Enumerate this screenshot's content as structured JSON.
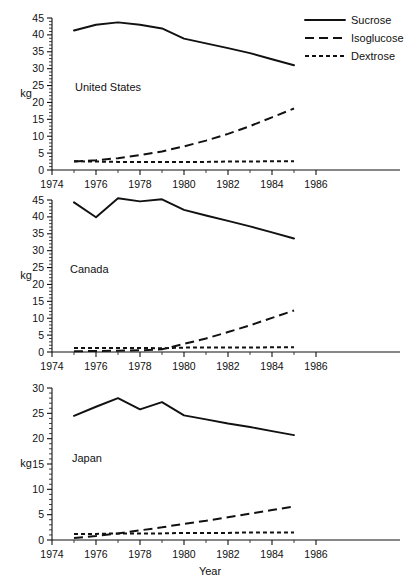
{
  "figure": {
    "xlabel": "Year",
    "ylabel": "kg",
    "legend": [
      {
        "name": "Sucrose",
        "style": "solid"
      },
      {
        "name": "Isoglucose",
        "style": "long-dash"
      },
      {
        "name": "Dextrose",
        "style": "short-dash"
      }
    ]
  },
  "chart_data": [
    {
      "type": "line",
      "title": "United States",
      "xlabel": "Year",
      "ylabel": "kg",
      "xlim": [
        1974,
        1987
      ],
      "ylim": [
        0,
        45
      ],
      "xticks": [
        1974,
        1976,
        1978,
        1980,
        1982,
        1984,
        1986
      ],
      "yticks": [
        0,
        5,
        10,
        15,
        20,
        25,
        30,
        35,
        40,
        45
      ],
      "grid": false,
      "legend_position": "top-right",
      "x": [
        1975,
        1976,
        1977,
        1978,
        1979,
        1980,
        1981,
        1982,
        1983,
        1984,
        1985
      ],
      "series": [
        {
          "name": "Sucrose",
          "style": "solid",
          "values": [
            41.3,
            43.0,
            43.7,
            43.0,
            41.9,
            38.9,
            37.5,
            36.1,
            34.6,
            32.8,
            31.0
          ]
        },
        {
          "name": "Isoglucose",
          "style": "long-dash",
          "values": [
            2.5,
            2.9,
            3.5,
            4.4,
            5.5,
            7.0,
            8.7,
            10.7,
            13.0,
            15.6,
            18.2
          ]
        },
        {
          "name": "Dextrose",
          "style": "short-dash",
          "values": [
            2.6,
            2.5,
            2.4,
            2.4,
            2.4,
            2.4,
            2.4,
            2.5,
            2.5,
            2.6,
            2.6
          ]
        }
      ]
    },
    {
      "type": "line",
      "title": "Canada",
      "xlabel": "Year",
      "ylabel": "kg",
      "xlim": [
        1974,
        1987
      ],
      "ylim": [
        0,
        45
      ],
      "xticks": [
        1974,
        1976,
        1978,
        1980,
        1982,
        1984,
        1986
      ],
      "yticks": [
        0,
        5,
        10,
        15,
        20,
        25,
        30,
        35,
        40,
        45
      ],
      "grid": false,
      "x": [
        1975,
        1976,
        1977,
        1978,
        1979,
        1980,
        1981,
        1982,
        1983,
        1984,
        1985
      ],
      "series": [
        {
          "name": "Sucrose",
          "style": "solid",
          "values": [
            44.3,
            39.9,
            45.5,
            44.6,
            45.2,
            42.1,
            40.4,
            38.8,
            37.2,
            35.4,
            33.6
          ]
        },
        {
          "name": "Isoglucose",
          "style": "long-dash",
          "values": [
            0.2,
            0.3,
            0.4,
            0.5,
            0.8,
            2.4,
            4.0,
            5.9,
            7.9,
            10.1,
            12.3
          ]
        },
        {
          "name": "Dextrose",
          "style": "short-dash",
          "values": [
            1.2,
            1.2,
            1.2,
            1.2,
            1.1,
            1.3,
            1.3,
            1.3,
            1.3,
            1.4,
            1.4
          ]
        }
      ]
    },
    {
      "type": "line",
      "title": "Japan",
      "xlabel": "Year",
      "ylabel": "kg",
      "xlim": [
        1974,
        1987
      ],
      "ylim": [
        0,
        30
      ],
      "xticks": [
        1974,
        1976,
        1978,
        1980,
        1982,
        1984,
        1986
      ],
      "yticks": [
        0,
        5,
        10,
        15,
        20,
        25,
        30
      ],
      "grid": false,
      "x": [
        1975,
        1976,
        1977,
        1978,
        1979,
        1980,
        1981,
        1982,
        1983,
        1984,
        1985
      ],
      "series": [
        {
          "name": "Sucrose",
          "style": "solid",
          "values": [
            24.5,
            26.3,
            28.0,
            25.8,
            27.2,
            24.6,
            23.8,
            23.0,
            22.3,
            21.5,
            20.7
          ]
        },
        {
          "name": "Isoglucose",
          "style": "long-dash",
          "values": [
            0.4,
            0.8,
            1.3,
            1.9,
            2.5,
            3.2,
            3.8,
            4.5,
            5.2,
            5.9,
            6.6
          ]
        },
        {
          "name": "Dextrose",
          "style": "short-dash",
          "values": [
            1.2,
            1.2,
            1.3,
            1.3,
            1.3,
            1.4,
            1.4,
            1.4,
            1.5,
            1.5,
            1.5
          ]
        }
      ]
    }
  ]
}
